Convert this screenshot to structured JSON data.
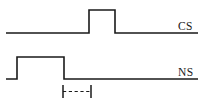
{
  "figure": {
    "type": "timing-diagram",
    "width": 203,
    "height": 107,
    "background_color": "#ffffff",
    "line_color": "#1a1a1a"
  },
  "traces": [
    {
      "id": "cs",
      "label": "CS",
      "label_x": 178,
      "label_y": 30,
      "baseline_y": 33,
      "high_y": 10,
      "start_x": 6,
      "end_x": 198,
      "pulse_start_x": 89,
      "pulse_end_x": 115,
      "path": "M 6,33 L 89,33 L 89,10 L 115,10 L 115,33 L 198,33"
    },
    {
      "id": "ns",
      "label": "NS",
      "label_x": 178,
      "label_y": 76,
      "baseline_y": 79,
      "high_y": 57,
      "start_x": 6,
      "end_x": 198,
      "pulse_start_x": 17,
      "pulse_end_x": 64,
      "path": "M 6,79 L 17,79 L 17,57 L 64,57 L 64,79 L 198,79"
    }
  ],
  "interval_marker": {
    "name": "trace-interval",
    "left_tick_x": 63,
    "right_tick_x": 91,
    "tick_top_y": 85,
    "tick_bottom_y": 98,
    "dash_y": 91.5
  }
}
